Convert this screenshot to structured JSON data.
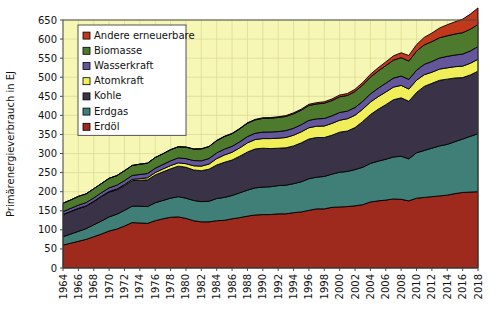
{
  "chart_data": {
    "type": "area",
    "stacked": true,
    "title": "",
    "xlabel": "",
    "ylabel": "Primärenergieverbrauch in EJ",
    "ylim": [
      0,
      650
    ],
    "ytick_step": 50,
    "yticks": [
      0,
      50,
      100,
      150,
      200,
      250,
      300,
      350,
      400,
      450,
      500,
      550,
      600,
      650
    ],
    "xlim": [
      1964,
      2018
    ],
    "xticks": [
      1964,
      1966,
      1968,
      1970,
      1972,
      1974,
      1976,
      1978,
      1980,
      1982,
      1984,
      1986,
      1988,
      1990,
      1992,
      1994,
      1996,
      1998,
      2000,
      2002,
      2004,
      2006,
      2008,
      2010,
      2012,
      2014,
      2016,
      2018
    ],
    "grid": true,
    "legend_position": "top-left",
    "plot_background": "#f7f7b5",
    "x": [
      1964,
      1965,
      1966,
      1967,
      1968,
      1969,
      1970,
      1971,
      1972,
      1973,
      1974,
      1975,
      1976,
      1977,
      1978,
      1979,
      1980,
      1981,
      1982,
      1983,
      1984,
      1985,
      1986,
      1987,
      1988,
      1989,
      1990,
      1991,
      1992,
      1993,
      1994,
      1995,
      1996,
      1997,
      1998,
      1999,
      2000,
      2001,
      2002,
      2003,
      2004,
      2005,
      2006,
      2007,
      2008,
      2009,
      2010,
      2011,
      2012,
      2013,
      2014,
      2015,
      2016,
      2017,
      2018
    ],
    "series": [
      {
        "name": "Erdöl",
        "color": "#9e2a1e",
        "values": [
          60,
          65,
          70,
          75,
          82,
          89,
          97,
          102,
          110,
          119,
          118,
          117,
          124,
          129,
          133,
          134,
          130,
          124,
          121,
          121,
          124,
          125,
          129,
          132,
          136,
          139,
          140,
          140,
          142,
          142,
          145,
          147,
          151,
          155,
          155,
          159,
          160,
          161,
          163,
          166,
          173,
          176,
          178,
          181,
          180,
          176,
          183,
          185,
          187,
          189,
          191,
          195,
          198,
          199,
          200
        ]
      },
      {
        "name": "Erdgas",
        "color": "#3f7f78",
        "values": [
          22,
          24,
          26,
          28,
          31,
          34,
          37,
          39,
          41,
          43,
          44,
          44,
          47,
          48,
          50,
          53,
          53,
          53,
          53,
          54,
          58,
          60,
          61,
          65,
          68,
          71,
          72,
          73,
          74,
          75,
          76,
          79,
          83,
          83,
          85,
          87,
          91,
          92,
          95,
          98,
          101,
          104,
          107,
          110,
          113,
          110,
          119,
          123,
          127,
          131,
          133,
          136,
          140,
          146,
          152
        ]
      },
      {
        "name": "Kohle",
        "color": "#3a3246",
        "values": [
          58,
          59,
          60,
          59,
          61,
          64,
          65,
          64,
          65,
          67,
          68,
          70,
          73,
          75,
          77,
          80,
          81,
          80,
          81,
          84,
          88,
          92,
          93,
          96,
          100,
          102,
          102,
          100,
          98,
          98,
          99,
          102,
          104,
          104,
          102,
          102,
          105,
          106,
          110,
          120,
          128,
          136,
          143,
          150,
          153,
          151,
          158,
          168,
          170,
          172,
          171,
          167,
          161,
          161,
          164
        ]
      },
      {
        "name": "Atomkraft",
        "color": "#f0ef5a",
        "values": [
          0.3,
          0.4,
          0.5,
          0.7,
          0.9,
          1.1,
          1.5,
          2.1,
          2.7,
          3.3,
          4.0,
          5.4,
          6.1,
          7.5,
          8.4,
          8.7,
          9.4,
          11.0,
          12.0,
          13.4,
          16.7,
          19.2,
          20.3,
          22.0,
          24.0,
          24.7,
          25.2,
          26.2,
          26.2,
          27.1,
          28.0,
          28.8,
          29.7,
          29.6,
          30.2,
          31.0,
          31.3,
          32.2,
          32.3,
          32.3,
          32.9,
          33.0,
          33.2,
          33.1,
          32.6,
          32.0,
          32.1,
          30.6,
          29.1,
          29.3,
          29.6,
          29.7,
          30.1,
          30.6,
          31.0
        ]
      },
      {
        "name": "Wasserkraft",
        "color": "#63569b",
        "values": [
          7.5,
          7.9,
          8.2,
          8.5,
          8.8,
          9.2,
          9.6,
          9.9,
          10.2,
          10.3,
          11.1,
          11.3,
          11.3,
          11.8,
          12.5,
          12.9,
          13.3,
          13.6,
          14.0,
          14.6,
          15.0,
          15.2,
          15.6,
          15.8,
          16.4,
          16.4,
          17.0,
          17.3,
          17.3,
          18.1,
          18.2,
          18.8,
          19.3,
          19.4,
          19.7,
          19.9,
          20.4,
          19.9,
          20.4,
          20.5,
          21.4,
          22.1,
          23.1,
          23.6,
          24.6,
          25.4,
          26.3,
          27.0,
          28.2,
          29.1,
          30.1,
          30.5,
          31.6,
          32.3,
          33.2
        ]
      },
      {
        "name": "Biomasse",
        "color": "#4e7a2e",
        "values": [
          22,
          22,
          23,
          23,
          24,
          24,
          25,
          25,
          26,
          26,
          27,
          27,
          28,
          28,
          29,
          29,
          30,
          30,
          31,
          31,
          32,
          33,
          33,
          34,
          35,
          35,
          36,
          36,
          37,
          37,
          38,
          38,
          39,
          39,
          40,
          40,
          41,
          41,
          42,
          43,
          44,
          45,
          46,
          47,
          48,
          48,
          50,
          51,
          52,
          53,
          54,
          55,
          56,
          57,
          58
        ]
      },
      {
        "name": "Andere erneuerbare",
        "color": "#c0391b",
        "values": [
          0.1,
          0.1,
          0.1,
          0.1,
          0.1,
          0.1,
          0.1,
          0.1,
          0.1,
          0.2,
          0.2,
          0.2,
          0.2,
          0.3,
          0.3,
          0.4,
          0.4,
          0.5,
          0.6,
          0.7,
          0.8,
          0.9,
          1.0,
          1.1,
          1.2,
          1.4,
          1.6,
          1.8,
          2.0,
          2.2,
          2.5,
          2.8,
          3.1,
          3.4,
          3.8,
          4.2,
          4.7,
          5.2,
          5.8,
          6.5,
          7.4,
          8.5,
          9.8,
          11.3,
          13.0,
          14.6,
          17.0,
          19.8,
          22.5,
          25.6,
          28.9,
          32.0,
          35.5,
          39.5,
          43.5
        ]
      }
    ],
    "legend_entries": [
      {
        "label": "Andere erneuerbare",
        "color": "#c0391b"
      },
      {
        "label": "Biomasse",
        "color": "#4e7a2e"
      },
      {
        "label": "Wasserkraft",
        "color": "#63569b"
      },
      {
        "label": "Atomkraft",
        "color": "#f0ef5a"
      },
      {
        "label": "Kohle",
        "color": "#3a3246"
      },
      {
        "label": "Erdgas",
        "color": "#3f7f78"
      },
      {
        "label": "Erdöl",
        "color": "#9e2a1e"
      }
    ]
  }
}
